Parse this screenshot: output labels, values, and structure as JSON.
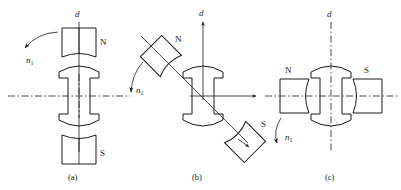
{
  "figure": {
    "background_color": "#ffffff",
    "line_color": "#1a1a1a",
    "panels": [
      {
        "id": "a",
        "caption": "(a)",
        "axis_label_d": "d",
        "pole_top_label": "N",
        "pole_bottom_label": "S",
        "rotation_label": "n",
        "rotation_subscript": "1",
        "description": "Poles aligned vertically with the d axis; rotor vertical",
        "vertical_axis_style": "solid",
        "horizontal_axis_style": "dash-dot"
      },
      {
        "id": "b",
        "caption": "(b)",
        "axis_label_d": "d",
        "pole_top_label": "N",
        "pole_bottom_label": "S",
        "rotation_label": "n",
        "rotation_subscript": "1",
        "description": "Poles rotated about 45 degrees from the d axis; rotor vertical",
        "vertical_axis_style": "solid-arrow",
        "horizontal_axis_style": "solid-arrow"
      },
      {
        "id": "c",
        "caption": "(c)",
        "axis_label_d": "d",
        "pole_left_label": "N",
        "pole_right_label": "S",
        "rotation_label": "n",
        "rotation_subscript": "1",
        "description": "Poles rotated 90 degrees, horizontal on the q axis; rotor vertical",
        "vertical_axis_style": "dash-dot",
        "horizontal_axis_style": "dash-dot"
      }
    ]
  }
}
